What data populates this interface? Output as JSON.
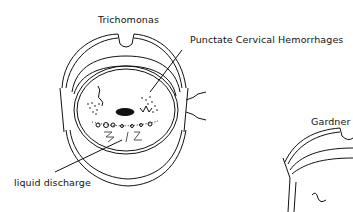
{
  "figure": {
    "labels": {
      "trichomonas": "Trichomonas",
      "punctate": "Punctate Cervical Hemorrhages",
      "liquid_discharge": "liquid discharge",
      "gardner": "Gardner"
    },
    "colors": {
      "ink": "#111111",
      "background": "#ffffff"
    }
  }
}
